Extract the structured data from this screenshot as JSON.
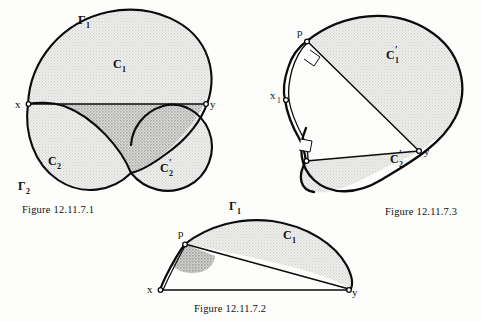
{
  "page": {
    "background_color": "#fdfdfb",
    "ink_color": "#0b0b0b",
    "shade_light_color": "#e3e3e1",
    "shade_dark_color": "#bcbcba"
  },
  "figures": [
    {
      "id": "figure-1",
      "caption": "Figure 12.11.7.1",
      "labels": {
        "gamma1": "Γ",
        "gamma1_sub": "1",
        "gamma2": "Γ",
        "gamma2_sub": "2",
        "c1": "C",
        "c1_sub": "1",
        "c2": "C",
        "c2_sub": "2",
        "c2prime": "C",
        "c2prime_sub": "2",
        "c2prime_prime": "′",
        "point_x": "x",
        "point_y": "y"
      }
    },
    {
      "id": "figure-3",
      "caption": "Figure 12.11.7.3",
      "labels": {
        "c1prime": "C",
        "c1prime_sub": "1",
        "c1prime_prime": "′",
        "c2prime": "C",
        "c2prime_sub": "2",
        "c2prime_prime": "′",
        "point_p": "p",
        "point_x1": "x",
        "point_x1_sub": "1",
        "point_y": "y"
      }
    },
    {
      "id": "figure-2",
      "caption": "Figure 12.11.7.2",
      "labels": {
        "gamma1": "Γ",
        "gamma1_sub": "1",
        "c1": "C",
        "c1_sub": "1",
        "point_p": "p",
        "point_x": "x",
        "point_y": "y"
      }
    }
  ]
}
